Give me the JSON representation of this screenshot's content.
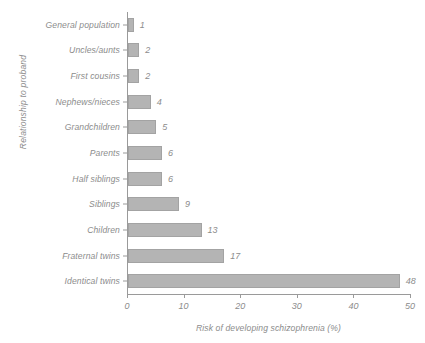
{
  "chart_data": {
    "type": "bar",
    "orientation": "horizontal",
    "title": "",
    "xlabel": "Risk of developing schizophrenia (%)",
    "ylabel": "Relationship to proband",
    "xlim": [
      0,
      50
    ],
    "xticks": [
      0,
      10,
      20,
      30,
      40,
      50
    ],
    "xtick_labels": [
      "0",
      "10",
      "20",
      "30",
      "40",
      "50"
    ],
    "grid": false,
    "legend": null,
    "bar_color": "#b4b4b4",
    "bar_edge_color": "#a3a3a3",
    "text_color": "#8c8c8c",
    "axis_color": "#9a9a9a",
    "categories": [
      "General population",
      "Uncles/aunts",
      "First cousins",
      "Nephews/nieces",
      "Grandchildren",
      "Parents",
      "Half siblings",
      "Siblings",
      "Children",
      "Fraternal twins",
      "Identical twins"
    ],
    "values": [
      1,
      2,
      2,
      4,
      5,
      6,
      6,
      9,
      13,
      17,
      48
    ],
    "value_labels": [
      "1",
      "2",
      "2",
      "4",
      "5",
      "6",
      "6",
      "9",
      "13",
      "17",
      "48"
    ]
  }
}
